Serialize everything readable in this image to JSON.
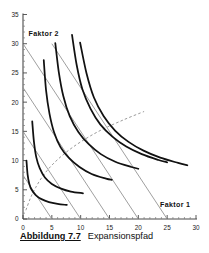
{
  "caption": {
    "number": "Abbildung 7.7",
    "title": "Expansionspfad"
  },
  "axes": {
    "x_label": "Faktor 1",
    "y_label": "Faktor 2",
    "x_ticks": [
      "0",
      "5",
      "10",
      "15",
      "20",
      "25",
      "30"
    ],
    "y_ticks": [
      "0",
      "5",
      "10",
      "15",
      "20",
      "25",
      "30",
      "35"
    ],
    "x_tick_values": [
      0,
      5,
      10,
      15,
      20,
      25,
      30
    ],
    "y_tick_values": [
      0,
      5,
      10,
      15,
      20,
      25,
      30,
      35
    ],
    "x_range": [
      0,
      30
    ],
    "y_range": [
      0,
      35
    ]
  },
  "chart_data": {
    "type": "line",
    "title": "Expansionspfad",
    "xlabel": "Faktor 1",
    "ylabel": "Faktor 2",
    "xlim": [
      0,
      30
    ],
    "ylim": [
      0,
      35
    ],
    "grid": false,
    "legend": "none",
    "series": [
      {
        "name": "Isoquante 1",
        "kind": "isoquant",
        "style": "solid-thick",
        "points": [
          [
            0.6,
            10.0
          ],
          [
            0.8,
            7.6
          ],
          [
            1.1,
            6.0
          ],
          [
            1.5,
            5.0
          ],
          [
            2.2,
            4.1
          ],
          [
            3.2,
            3.4
          ],
          [
            4.5,
            2.9
          ],
          [
            6.0,
            2.6
          ],
          [
            7.6,
            2.4
          ]
        ]
      },
      {
        "name": "Isoquante 2",
        "kind": "isoquant",
        "style": "solid-thick",
        "points": [
          [
            1.6,
            16.7
          ],
          [
            1.9,
            13.2
          ],
          [
            2.3,
            10.6
          ],
          [
            2.9,
            8.7
          ],
          [
            3.8,
            7.1
          ],
          [
            5.0,
            6.0
          ],
          [
            6.6,
            5.2
          ],
          [
            8.3,
            4.7
          ],
          [
            10.4,
            4.4
          ]
        ]
      },
      {
        "name": "Isoquante 3",
        "kind": "isoquant",
        "style": "solid-thick",
        "points": [
          [
            3.6,
            27.2
          ],
          [
            4.0,
            22.0
          ],
          [
            4.6,
            18.0
          ],
          [
            5.4,
            14.8
          ],
          [
            6.5,
            12.3
          ],
          [
            8.0,
            10.4
          ],
          [
            9.8,
            8.9
          ],
          [
            11.9,
            7.7
          ],
          [
            14.4,
            6.9
          ],
          [
            15.4,
            6.7
          ]
        ]
      },
      {
        "name": "Isoquante 4",
        "kind": "isoquant",
        "style": "solid-thick",
        "points": [
          [
            5.6,
            30.1
          ],
          [
            6.2,
            25.2
          ],
          [
            7.0,
            21.0
          ],
          [
            8.1,
            17.6
          ],
          [
            9.6,
            14.9
          ],
          [
            11.4,
            12.8
          ],
          [
            13.5,
            11.1
          ],
          [
            16.0,
            9.8
          ],
          [
            18.8,
            8.9
          ],
          [
            20.0,
            8.6
          ]
        ]
      },
      {
        "name": "Isoquante 5",
        "kind": "isoquant",
        "style": "solid-thick",
        "points": [
          [
            8.5,
            31.5
          ],
          [
            9.3,
            26.4
          ],
          [
            10.3,
            22.2
          ],
          [
            11.7,
            18.9
          ],
          [
            13.4,
            16.2
          ],
          [
            15.5,
            14.1
          ],
          [
            17.9,
            12.4
          ],
          [
            20.6,
            11.1
          ],
          [
            23.5,
            10.1
          ],
          [
            25.0,
            9.7
          ]
        ]
      },
      {
        "name": "Isoquante 6",
        "kind": "isoquant",
        "style": "solid-thick",
        "points": [
          [
            9.9,
            30.2
          ],
          [
            11.0,
            25.0
          ],
          [
            12.3,
            20.8
          ],
          [
            14.0,
            17.6
          ],
          [
            16.0,
            15.1
          ],
          [
            18.3,
            13.2
          ],
          [
            20.9,
            11.7
          ],
          [
            23.8,
            10.5
          ],
          [
            26.9,
            9.6
          ],
          [
            28.5,
            9.2
          ]
        ]
      },
      {
        "name": "Isokostengerade 1",
        "kind": "isocost",
        "style": "solid-thin-gray",
        "points": [
          [
            0,
            7.5
          ],
          [
            5,
            0
          ]
        ]
      },
      {
        "name": "Isokostengerade 2",
        "kind": "isocost",
        "style": "solid-thin-gray",
        "points": [
          [
            0,
            15.0
          ],
          [
            10,
            0
          ]
        ]
      },
      {
        "name": "Isokostengerade 3",
        "kind": "isocost",
        "style": "solid-thin-gray",
        "points": [
          [
            0,
            22.5
          ],
          [
            15,
            0
          ]
        ]
      },
      {
        "name": "Isokostengerade 4",
        "kind": "isocost",
        "style": "solid-thin-gray",
        "points": [
          [
            0,
            30.0
          ],
          [
            20,
            0
          ]
        ]
      },
      {
        "name": "Isokostengerade 5",
        "kind": "isocost",
        "style": "solid-thin-gray",
        "points": [
          [
            5,
            30.0
          ],
          [
            25,
            0
          ]
        ]
      },
      {
        "name": "Expansionspfad",
        "kind": "expansion-path",
        "style": "dashed-gray",
        "points": [
          [
            0.5,
            1.5
          ],
          [
            1.3,
            3.6
          ],
          [
            2.2,
            5.4
          ],
          [
            3.4,
            7.3
          ],
          [
            5.0,
            9.2
          ],
          [
            7.2,
            11.2
          ],
          [
            10.0,
            13.2
          ],
          [
            13.5,
            15.2
          ],
          [
            17.5,
            17.0
          ],
          [
            21.0,
            18.4
          ]
        ]
      }
    ]
  }
}
